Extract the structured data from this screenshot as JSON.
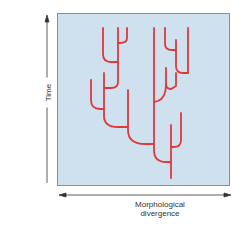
{
  "figure": {
    "type": "diagram",
    "panel_background": "#cfe0ef",
    "panel_border": "#8a8f96",
    "branch_color": "#e0393b",
    "axis_color": "#333333"
  },
  "axes": {
    "y_label": "Time",
    "x_label_line1": "Morphological",
    "x_label_line2": "divergence",
    "y_arrow": "up",
    "x_arrow": "both"
  },
  "tree": {
    "root": {
      "x": 171,
      "y": 178
    },
    "tip_count": 12
  }
}
